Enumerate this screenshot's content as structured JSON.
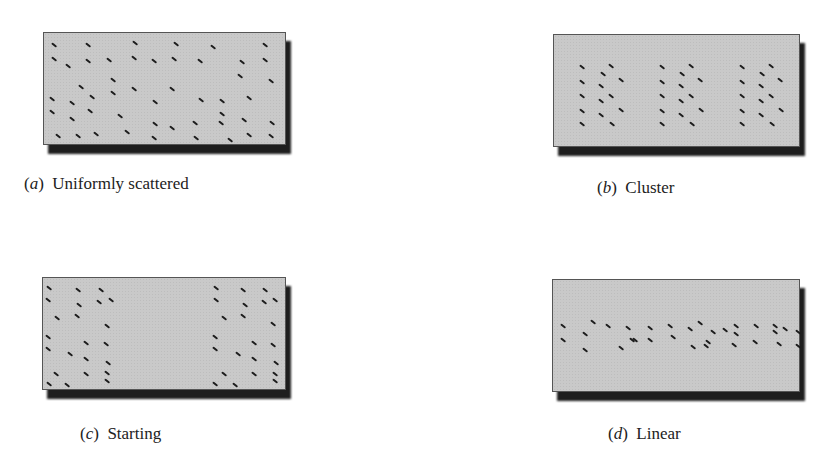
{
  "figure": {
    "panels": [
      {
        "id": "a",
        "letter": "a",
        "label": "Uniformly scattered",
        "box": {
          "x": 43,
          "y": 32,
          "w": 243,
          "h": 113
        },
        "caption_pos": {
          "x": 24,
          "y": 174
        },
        "dashes": [
          [
            10,
            12
          ],
          [
            44,
            12
          ],
          [
            91,
            10
          ],
          [
            132,
            11
          ],
          [
            169,
            14
          ],
          [
            221,
            12
          ],
          [
            10,
            26
          ],
          [
            44,
            28
          ],
          [
            65,
            27
          ],
          [
            90,
            25
          ],
          [
            110,
            28
          ],
          [
            130,
            26
          ],
          [
            156,
            28
          ],
          [
            198,
            29
          ],
          [
            221,
            27
          ],
          [
            24,
            33
          ],
          [
            196,
            43
          ],
          [
            227,
            48
          ],
          [
            69,
            47
          ],
          [
            37,
            54
          ],
          [
            90,
            56
          ],
          [
            128,
            56
          ],
          [
            69,
            60
          ],
          [
            8,
            66
          ],
          [
            28,
            70
          ],
          [
            48,
            64
          ],
          [
            111,
            69
          ],
          [
            157,
            67
          ],
          [
            178,
            68
          ],
          [
            205,
            65
          ],
          [
            8,
            79
          ],
          [
            28,
            86
          ],
          [
            46,
            78
          ],
          [
            76,
            83
          ],
          [
            178,
            81
          ],
          [
            200,
            87
          ],
          [
            228,
            90
          ],
          [
            111,
            91
          ],
          [
            128,
            95
          ],
          [
            151,
            90
          ],
          [
            177,
            90
          ],
          [
            14,
            103
          ],
          [
            34,
            103
          ],
          [
            52,
            101
          ],
          [
            83,
            99
          ],
          [
            110,
            105
          ],
          [
            152,
            105
          ],
          [
            186,
            107
          ],
          [
            205,
            102
          ],
          [
            227,
            103
          ]
        ]
      },
      {
        "id": "b",
        "letter": "b",
        "label": "Cluster",
        "box": {
          "x": 553,
          "y": 34,
          "w": 247,
          "h": 113
        },
        "caption_pos": {
          "x": 597,
          "y": 178
        },
        "dashes": [
          [
            28,
            32
          ],
          [
            57,
            31
          ],
          [
            49,
            39
          ],
          [
            67,
            45
          ],
          [
            28,
            47
          ],
          [
            47,
            51
          ],
          [
            28,
            61
          ],
          [
            57,
            61
          ],
          [
            47,
            66
          ],
          [
            67,
            75
          ],
          [
            28,
            76
          ],
          [
            47,
            80
          ],
          [
            28,
            89
          ],
          [
            58,
            89
          ],
          [
            108,
            32
          ],
          [
            137,
            31
          ],
          [
            128,
            39
          ],
          [
            146,
            45
          ],
          [
            108,
            47
          ],
          [
            127,
            51
          ],
          [
            108,
            61
          ],
          [
            137,
            61
          ],
          [
            127,
            66
          ],
          [
            147,
            75
          ],
          [
            108,
            76
          ],
          [
            127,
            80
          ],
          [
            108,
            89
          ],
          [
            138,
            89
          ],
          [
            188,
            32
          ],
          [
            217,
            31
          ],
          [
            208,
            39
          ],
          [
            226,
            45
          ],
          [
            188,
            47
          ],
          [
            207,
            51
          ],
          [
            188,
            61
          ],
          [
            217,
            61
          ],
          [
            207,
            66
          ],
          [
            227,
            75
          ],
          [
            188,
            76
          ],
          [
            207,
            80
          ],
          [
            188,
            89
          ],
          [
            218,
            89
          ]
        ]
      },
      {
        "id": "c",
        "letter": "c",
        "label": "Starting",
        "box": {
          "x": 42,
          "y": 277,
          "w": 244,
          "h": 113
        },
        "caption_pos": {
          "x": 80,
          "y": 424
        },
        "dashes": [
          [
            6,
            10
          ],
          [
            35,
            12
          ],
          [
            58,
            12
          ],
          [
            5,
            22
          ],
          [
            36,
            27
          ],
          [
            56,
            24
          ],
          [
            68,
            22
          ],
          [
            14,
            40
          ],
          [
            34,
            38
          ],
          [
            64,
            48
          ],
          [
            5,
            59
          ],
          [
            43,
            65
          ],
          [
            63,
            66
          ],
          [
            5,
            71
          ],
          [
            27,
            76
          ],
          [
            43,
            81
          ],
          [
            65,
            85
          ],
          [
            13,
            96
          ],
          [
            43,
            96
          ],
          [
            64,
            95
          ],
          [
            6,
            106
          ],
          [
            24,
            107
          ],
          [
            64,
            103
          ],
          [
            173,
            10
          ],
          [
            200,
            12
          ],
          [
            222,
            12
          ],
          [
            173,
            22
          ],
          [
            202,
            27
          ],
          [
            221,
            24
          ],
          [
            232,
            22
          ],
          [
            181,
            40
          ],
          [
            200,
            38
          ],
          [
            230,
            46
          ],
          [
            172,
            59
          ],
          [
            211,
            65
          ],
          [
            230,
            67
          ],
          [
            172,
            71
          ],
          [
            195,
            76
          ],
          [
            211,
            81
          ],
          [
            233,
            85
          ],
          [
            181,
            96
          ],
          [
            211,
            96
          ],
          [
            232,
            96
          ],
          [
            172,
            106
          ],
          [
            192,
            107
          ],
          [
            232,
            103
          ]
        ]
      },
      {
        "id": "d",
        "letter": "d",
        "label": "Linear",
        "box": {
          "x": 552,
          "y": 279,
          "w": 248,
          "h": 113
        },
        "caption_pos": {
          "x": 608,
          "y": 424
        },
        "dashes": [
          [
            10,
            46
          ],
          [
            40,
            42
          ],
          [
            32,
            54
          ],
          [
            55,
            46
          ],
          [
            75,
            48
          ],
          [
            82,
            60
          ],
          [
            10,
            60
          ],
          [
            32,
            70
          ],
          [
            68,
            68
          ],
          [
            79,
            60
          ],
          [
            97,
            60
          ],
          [
            120,
            57
          ],
          [
            97,
            48
          ],
          [
            117,
            46
          ],
          [
            137,
            49
          ],
          [
            140,
            67
          ],
          [
            153,
            66
          ],
          [
            147,
            43
          ],
          [
            155,
            62
          ],
          [
            183,
            46
          ],
          [
            181,
            65
          ],
          [
            203,
            46
          ],
          [
            222,
            46
          ],
          [
            202,
            62
          ],
          [
            226,
            64
          ],
          [
            222,
            52
          ],
          [
            232,
            49
          ],
          [
            245,
            52
          ],
          [
            245,
            66
          ],
          [
            172,
            50
          ],
          [
            160,
            52
          ],
          [
            183,
            54
          ]
        ]
      }
    ]
  }
}
